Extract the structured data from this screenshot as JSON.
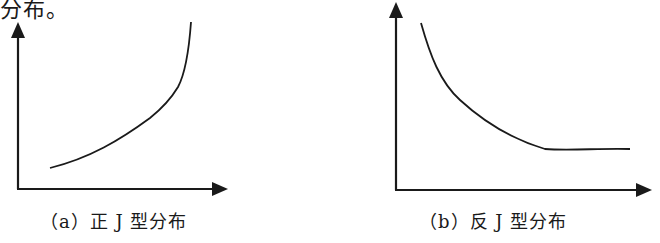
{
  "top_text_fragment": "分布。",
  "figures": [
    {
      "id": "a",
      "caption": "（a）正 J 型分布",
      "curve_shape": "increasing, convex (J-shaped)"
    },
    {
      "id": "b",
      "caption": "（b）反 J 型分布",
      "curve_shape": "decreasing, convex, levelling off (reverse J-shaped)"
    }
  ],
  "colors": {
    "stroke": "#1a1a1a",
    "background": "#ffffff"
  }
}
